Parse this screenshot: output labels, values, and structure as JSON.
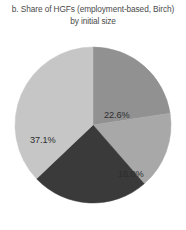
{
  "chart_data": {
    "type": "pie",
    "title": "b. Share of HGFs (employment-based, Birch) by initial size",
    "title_lines": [
      "b. Share of HGFs (employment-based, Birch)",
      "by initial size"
    ],
    "xlabel": "",
    "ylabel": "",
    "grid": false,
    "legend": "none",
    "start_angle_deg": 0,
    "direction": "clockwise",
    "categories": [
      "22.6%",
      "16.0%",
      "24.3%",
      "37.1%"
    ],
    "values": [
      22.6,
      16.0,
      24.3,
      37.1
    ],
    "labels": [
      "22.6%",
      "16.0%",
      "24.3%",
      "37.1%"
    ],
    "colors": [
      "#919191",
      "#a8a8a8",
      "#3a3a3a",
      "#c6c6c6"
    ],
    "label_text_colors": [
      "#2e2e2e",
      "#2e2e2e",
      "#ffffff",
      "#2e2e2e"
    ],
    "slices": [
      {
        "label": "22.6%",
        "value": 22.6,
        "color": "#919191",
        "text_color": "#2e2e2e"
      },
      {
        "label": "16.0%",
        "value": 16.0,
        "color": "#a8a8a8",
        "text_color": "#2e2e2e"
      },
      {
        "label": "24.3%",
        "value": 24.3,
        "color": "#3a3a3a",
        "text_color": "#ffffff"
      },
      {
        "label": "37.1%",
        "value": 37.1,
        "color": "#c6c6c6",
        "text_color": "#2e2e2e"
      }
    ]
  },
  "figure": {
    "background_color": "#ffffff",
    "title_color": "#4a4a4a"
  }
}
